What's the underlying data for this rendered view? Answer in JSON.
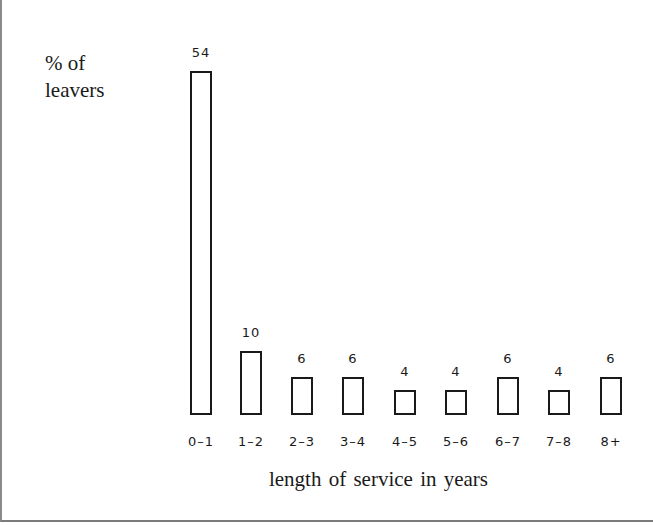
{
  "chart_data": {
    "type": "bar",
    "title": "",
    "xlabel": "length of service in years",
    "ylabel": "% of leavers",
    "ylabel_lines": [
      "% of",
      "leavers"
    ],
    "categories": [
      "0–1",
      "1–2",
      "2–3",
      "3–4",
      "4–5",
      "5–6",
      "6–7",
      "7–8",
      "8+"
    ],
    "values": [
      54,
      10,
      6,
      6,
      4,
      4,
      6,
      4,
      6
    ],
    "value_labels": [
      "54",
      "10",
      "6",
      "6",
      "4",
      "4",
      "6",
      "4",
      "6"
    ],
    "ylim": [
      0,
      54
    ],
    "grid": false,
    "legend": null,
    "bar_style": "outlined, unfilled"
  }
}
